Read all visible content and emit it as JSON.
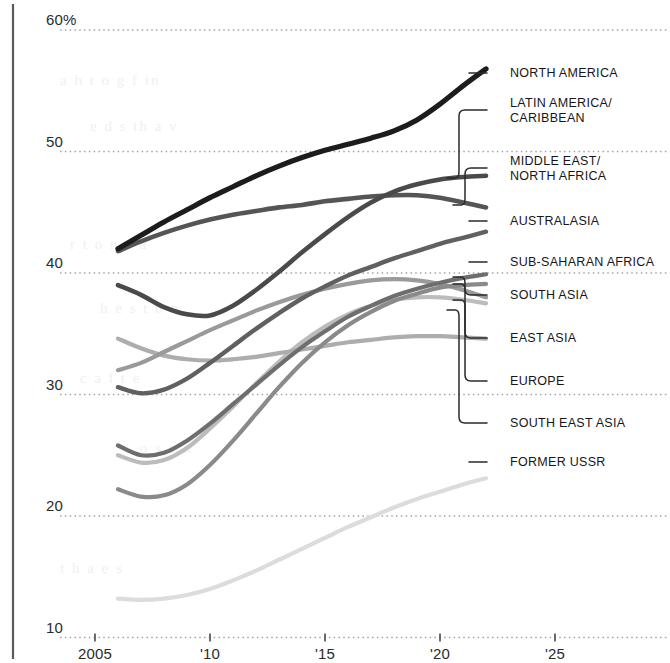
{
  "chart_data": {
    "type": "line",
    "title": "",
    "subtitle": "",
    "xlabel": "",
    "ylabel": "",
    "unit": "%",
    "xlim": [
      2005,
      2026
    ],
    "ylim": [
      9,
      61
    ],
    "grid": "horizontal-dotted",
    "legend_position": "right",
    "x_ticks": [
      "2005",
      "'10",
      "'15",
      "'20",
      "'25"
    ],
    "x_tick_values": [
      2005,
      2010,
      2015,
      2020,
      2025
    ],
    "y_ticks": [
      "60%",
      "50",
      "40",
      "30",
      "20",
      "10"
    ],
    "y_tick_values": [
      60,
      50,
      40,
      30,
      20,
      10
    ],
    "series": [
      {
        "name": "NORTH AMERICA",
        "color": "#1c1c1c",
        "width": 5.2,
        "x": [
          2006,
          2007,
          2008,
          2009,
          2010,
          2011,
          2012,
          2013,
          2014,
          2015,
          2016,
          2017,
          2018,
          2019,
          2020,
          2021,
          2022
        ],
        "values": [
          42.0,
          43.1,
          44.2,
          45.2,
          46.2,
          47.1,
          48.0,
          48.8,
          49.5,
          50.1,
          50.6,
          51.1,
          51.7,
          52.6,
          53.9,
          55.4,
          56.8
        ]
      },
      {
        "name": "LATIN AMERICA/\nCARIBBEAN",
        "color": "#4a4a4a",
        "width": 4.6,
        "x": [
          2006,
          2007,
          2008,
          2009,
          2010,
          2011,
          2012,
          2013,
          2014,
          2015,
          2016,
          2017,
          2018,
          2019,
          2020,
          2021,
          2022
        ],
        "values": [
          39.0,
          38.2,
          37.2,
          36.6,
          36.5,
          37.3,
          38.6,
          40.1,
          41.7,
          43.2,
          44.6,
          45.8,
          46.7,
          47.3,
          47.7,
          47.9,
          48.0
        ]
      },
      {
        "name": "MIDDLE EAST/\nNORTH AFRICA",
        "color": "#555555",
        "width": 4.6,
        "x": [
          2006,
          2007,
          2008,
          2009,
          2010,
          2011,
          2012,
          2013,
          2014,
          2015,
          2016,
          2017,
          2018,
          2019,
          2020,
          2021,
          2022
        ],
        "values": [
          41.8,
          42.6,
          43.3,
          43.9,
          44.4,
          44.8,
          45.1,
          45.4,
          45.6,
          45.9,
          46.1,
          46.3,
          46.4,
          46.4,
          46.2,
          45.8,
          45.4
        ]
      },
      {
        "name": "AUSTRALASIA",
        "color": "#606060",
        "width": 4.4,
        "x": [
          2006,
          2007,
          2008,
          2009,
          2010,
          2011,
          2012,
          2013,
          2014,
          2015,
          2016,
          2017,
          2018,
          2019,
          2020,
          2021,
          2022
        ],
        "values": [
          30.6,
          30.1,
          30.4,
          31.3,
          32.6,
          34.0,
          35.4,
          36.7,
          37.9,
          38.9,
          39.8,
          40.5,
          41.2,
          41.8,
          42.4,
          42.9,
          43.4
        ]
      },
      {
        "name": "SUB-SAHARAN AFRICA",
        "color": "#6e6e6e",
        "width": 4.2,
        "x": [
          2006,
          2007,
          2008,
          2009,
          2010,
          2011,
          2012,
          2013,
          2014,
          2015,
          2016,
          2017,
          2018,
          2019,
          2020,
          2021,
          2022
        ],
        "values": [
          25.8,
          25.0,
          25.2,
          26.2,
          27.6,
          29.2,
          30.8,
          32.4,
          33.9,
          35.2,
          36.4,
          37.3,
          38.1,
          38.7,
          39.2,
          39.6,
          39.9
        ]
      },
      {
        "name": "SOUTH ASIA",
        "color": "#8a8a8a",
        "width": 4.2,
        "x": [
          2006,
          2007,
          2008,
          2009,
          2010,
          2011,
          2012,
          2013,
          2014,
          2015,
          2016,
          2017,
          2018,
          2019,
          2020,
          2021,
          2022
        ],
        "values": [
          22.2,
          21.6,
          21.7,
          22.6,
          24.2,
          26.2,
          28.4,
          30.6,
          32.6,
          34.3,
          35.7,
          36.8,
          37.7,
          38.3,
          38.8,
          39.0,
          39.1
        ]
      },
      {
        "name": "EAST ASIA",
        "color": "#9a9a9a",
        "width": 4.2,
        "x": [
          2006,
          2007,
          2008,
          2009,
          2010,
          2011,
          2012,
          2013,
          2014,
          2015,
          2016,
          2017,
          2018,
          2019,
          2020,
          2021,
          2022
        ],
        "values": [
          32.0,
          32.6,
          33.5,
          34.4,
          35.3,
          36.1,
          36.9,
          37.6,
          38.2,
          38.7,
          39.1,
          39.4,
          39.5,
          39.4,
          39.1,
          38.6,
          38.0
        ]
      },
      {
        "name": "EUROPE",
        "color": "#adadad",
        "width": 4.2,
        "x": [
          2006,
          2007,
          2008,
          2009,
          2010,
          2011,
          2012,
          2013,
          2014,
          2015,
          2016,
          2017,
          2018,
          2019,
          2020,
          2021,
          2022
        ],
        "values": [
          34.6,
          33.8,
          33.2,
          32.9,
          32.8,
          32.9,
          33.1,
          33.4,
          33.7,
          34.0,
          34.3,
          34.5,
          34.7,
          34.8,
          34.8,
          34.7,
          34.6
        ]
      },
      {
        "name": "SOUTH EAST ASIA",
        "color": "#bcbcbc",
        "width": 4.2,
        "x": [
          2006,
          2007,
          2008,
          2009,
          2010,
          2011,
          2012,
          2013,
          2014,
          2015,
          2016,
          2017,
          2018,
          2019,
          2020,
          2021,
          2022
        ],
        "values": [
          25.0,
          24.4,
          24.6,
          25.6,
          27.2,
          29.0,
          30.9,
          32.7,
          34.3,
          35.6,
          36.6,
          37.3,
          37.8,
          38.0,
          38.0,
          37.8,
          37.5
        ]
      },
      {
        "name": "FORMER USSR",
        "color": "#dcdcdc",
        "width": 4.2,
        "x": [
          2006,
          2007,
          2008,
          2009,
          2010,
          2011,
          2012,
          2013,
          2014,
          2015,
          2016,
          2017,
          2018,
          2019,
          2020,
          2021,
          2022
        ],
        "values": [
          13.2,
          13.1,
          13.2,
          13.5,
          14.0,
          14.7,
          15.5,
          16.4,
          17.3,
          18.2,
          19.1,
          19.9,
          20.7,
          21.4,
          22.0,
          22.6,
          23.1
        ]
      }
    ]
  },
  "legend": [
    {
      "label": "NORTH AMERICA",
      "y": 73,
      "anchor": 78,
      "style": "dash"
    },
    {
      "label": "LATIN AMERICA/\nCARIBBEAN",
      "y": 110,
      "anchor": 178,
      "style": "bracket-down"
    },
    {
      "label": "MIDDLE EAST/\nNORTH AFRICA",
      "y": 168,
      "anchor": 205,
      "style": "bracket-up"
    },
    {
      "label": "AUSTRALASIA",
      "y": 221,
      "anchor": 221,
      "style": "dash"
    },
    {
      "label": "SUB-SAHARAN AFRICA",
      "y": 262,
      "anchor": 266,
      "style": "dash"
    },
    {
      "label": "EAST ASIA",
      "y": 338,
      "anchor": 277,
      "style": "bracket-up"
    },
    {
      "label": "SOUTH ASIA",
      "y": 295,
      "anchor": 284,
      "style": "bracket-up"
    },
    {
      "label": "EUROPE",
      "y": 381,
      "anchor": 300,
      "style": "bracket-up"
    },
    {
      "label": "SOUTH EAST ASIA",
      "y": 423,
      "anchor": 310,
      "style": "bracket-down"
    },
    {
      "label": "FORMER USSR",
      "y": 462,
      "anchor": 463,
      "style": "dash"
    }
  ],
  "bleed_text": [
    "a",
    "to",
    "of",
    "the",
    "in",
    "and",
    "for",
    "on",
    "with"
  ]
}
